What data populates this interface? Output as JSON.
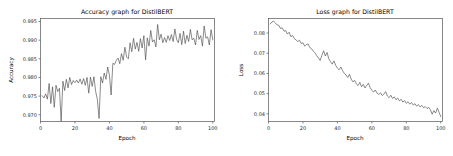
{
  "figure": {
    "width": 453,
    "height": 156,
    "background": "#ffffff",
    "line_color": "#4c4c4c",
    "axis_color": "#555555"
  },
  "chart_data": [
    {
      "type": "line",
      "id": "accuracy",
      "title": "Accuracy graph for DistilBERT",
      "xlabel": "Epoch",
      "ylabel": "Accuracy",
      "xlim": [
        0,
        101
      ],
      "ylim": [
        0.9682,
        0.9958
      ],
      "xticks": [
        0,
        20,
        40,
        60,
        80,
        100
      ],
      "xticklabels": [
        "0",
        "20",
        "40",
        "60",
        "80",
        "100"
      ],
      "yticks": [
        0.97,
        0.975,
        0.98,
        0.985,
        0.99,
        0.995
      ],
      "yticklabels": [
        "0.970",
        "0.975",
        "0.980",
        "0.985",
        "0.990",
        "0.995"
      ],
      "grid": false,
      "legend": null,
      "x": [
        1,
        2,
        3,
        4,
        5,
        6,
        7,
        8,
        9,
        10,
        11,
        12,
        13,
        14,
        15,
        16,
        17,
        18,
        19,
        20,
        21,
        22,
        23,
        24,
        25,
        26,
        27,
        28,
        29,
        30,
        31,
        32,
        33,
        34,
        35,
        36,
        37,
        38,
        39,
        40,
        41,
        42,
        43,
        44,
        45,
        46,
        47,
        48,
        49,
        50,
        51,
        52,
        53,
        54,
        55,
        56,
        57,
        58,
        59,
        60,
        61,
        62,
        63,
        64,
        65,
        66,
        67,
        68,
        69,
        70,
        71,
        72,
        73,
        74,
        75,
        76,
        77,
        78,
        79,
        80,
        81,
        82,
        83,
        84,
        85,
        86,
        87,
        88,
        89,
        90,
        91,
        92,
        93,
        94,
        95,
        96,
        97,
        98,
        99,
        100
      ],
      "values": [
        0.9751,
        0.9745,
        0.9756,
        0.9742,
        0.9784,
        0.973,
        0.9775,
        0.972,
        0.9779,
        0.9762,
        0.9771,
        0.9683,
        0.979,
        0.9765,
        0.9795,
        0.9772,
        0.98,
        0.9781,
        0.9792,
        0.9786,
        0.9793,
        0.9785,
        0.9796,
        0.9782,
        0.9797,
        0.9779,
        0.98,
        0.9758,
        0.9801,
        0.9776,
        0.9802,
        0.9763,
        0.9741,
        0.969,
        0.9802,
        0.9785,
        0.9812,
        0.9795,
        0.9828,
        0.9806,
        0.9753,
        0.9838,
        0.9835,
        0.9846,
        0.9852,
        0.9837,
        0.9864,
        0.9846,
        0.9881,
        0.9855,
        0.985,
        0.9893,
        0.9869,
        0.9905,
        0.9876,
        0.9894,
        0.987,
        0.9904,
        0.9879,
        0.9912,
        0.9847,
        0.9906,
        0.9884,
        0.9926,
        0.9895,
        0.9901,
        0.9882,
        0.9942,
        0.9901,
        0.9916,
        0.9893,
        0.9907,
        0.9894,
        0.9912,
        0.9899,
        0.9915,
        0.9896,
        0.993,
        0.9902,
        0.9893,
        0.9918,
        0.9888,
        0.9924,
        0.9891,
        0.9913,
        0.9896,
        0.9929,
        0.9901,
        0.9905,
        0.9887,
        0.9926,
        0.9902,
        0.9912,
        0.9884,
        0.9938,
        0.9905,
        0.9909,
        0.9887,
        0.9928,
        0.9901
      ]
    },
    {
      "type": "line",
      "id": "loss",
      "title": "Loss graph for DistilBERT",
      "xlabel": "Epoch",
      "ylabel": "Loss",
      "xlim": [
        0,
        101
      ],
      "ylim": [
        0.0362,
        0.0872
      ],
      "xticks": [
        0,
        20,
        40,
        60,
        80,
        100
      ],
      "xticklabels": [
        "0",
        "20",
        "40",
        "60",
        "80",
        "100"
      ],
      "yticks": [
        0.04,
        0.05,
        0.06,
        0.07,
        0.08
      ],
      "yticklabels": [
        "0.04",
        "0.05",
        "0.06",
        "0.07",
        "0.08"
      ],
      "grid": false,
      "legend": null,
      "x": [
        1,
        2,
        3,
        4,
        5,
        6,
        7,
        8,
        9,
        10,
        11,
        12,
        13,
        14,
        15,
        16,
        17,
        18,
        19,
        20,
        21,
        22,
        23,
        24,
        25,
        26,
        27,
        28,
        29,
        30,
        31,
        32,
        33,
        34,
        35,
        36,
        37,
        38,
        39,
        40,
        41,
        42,
        43,
        44,
        45,
        46,
        47,
        48,
        49,
        50,
        51,
        52,
        53,
        54,
        55,
        56,
        57,
        58,
        59,
        60,
        61,
        62,
        63,
        64,
        65,
        66,
        67,
        68,
        69,
        70,
        71,
        72,
        73,
        74,
        75,
        76,
        77,
        78,
        79,
        80,
        81,
        82,
        83,
        84,
        85,
        86,
        87,
        88,
        89,
        90,
        91,
        92,
        93,
        94,
        95,
        96,
        97,
        98,
        99,
        100
      ],
      "values": [
        0.0845,
        0.0855,
        0.0858,
        0.085,
        0.084,
        0.0838,
        0.0822,
        0.0826,
        0.0809,
        0.0812,
        0.0795,
        0.0804,
        0.0782,
        0.0788,
        0.0772,
        0.0766,
        0.0758,
        0.0764,
        0.0748,
        0.0752,
        0.0735,
        0.0743,
        0.0746,
        0.0728,
        0.0722,
        0.071,
        0.0702,
        0.0688,
        0.0676,
        0.0664,
        0.069,
        0.0712,
        0.0686,
        0.0704,
        0.0672,
        0.0658,
        0.0646,
        0.0662,
        0.064,
        0.0626,
        0.0618,
        0.0632,
        0.0614,
        0.06,
        0.0592,
        0.058,
        0.0596,
        0.0572,
        0.0558,
        0.0566,
        0.0548,
        0.054,
        0.0556,
        0.0534,
        0.0546,
        0.0528,
        0.054,
        0.0552,
        0.053,
        0.0516,
        0.0508,
        0.0518,
        0.0502,
        0.0496,
        0.0504,
        0.049,
        0.0498,
        0.051,
        0.0488,
        0.048,
        0.0492,
        0.0476,
        0.0484,
        0.047,
        0.0478,
        0.0464,
        0.0472,
        0.0458,
        0.0466,
        0.0452,
        0.046,
        0.0448,
        0.0456,
        0.0444,
        0.045,
        0.0438,
        0.0446,
        0.0434,
        0.0442,
        0.043,
        0.0436,
        0.0426,
        0.0432,
        0.042,
        0.0398,
        0.0416,
        0.0404,
        0.0428,
        0.0408,
        0.0386,
        0.0412,
        0.0368
      ]
    }
  ]
}
